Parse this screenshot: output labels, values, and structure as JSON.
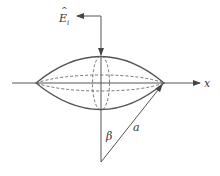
{
  "diagram": {
    "labels": {
      "field": "E",
      "field_hat": "^",
      "field_sub": "i",
      "axis": "x",
      "angle": "β",
      "radius": "a"
    },
    "colors": {
      "stroke": "#555555",
      "text": "#333333",
      "background": "#ffffff"
    }
  }
}
